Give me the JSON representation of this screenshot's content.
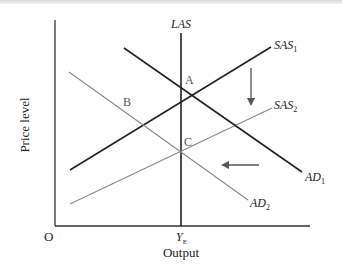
{
  "diagram": {
    "type": "AD-AS model",
    "axes": {
      "y_label": "Price level",
      "x_label": "Output",
      "origin_label": "O",
      "x_tick": {
        "main": "Y",
        "sub": "E"
      }
    },
    "curves": {
      "las": {
        "label": "LAS",
        "color": "#222222"
      },
      "sas1": {
        "main": "SAS",
        "sub": "1",
        "color": "#222222"
      },
      "sas2": {
        "main": "SAS",
        "sub": "2",
        "color": "#8a8a8a"
      },
      "ad1": {
        "main": "AD",
        "sub": "1",
        "color": "#222222"
      },
      "ad2": {
        "main": "AD",
        "sub": "2",
        "color": "#8a8a8a"
      }
    },
    "points": {
      "a": "A",
      "b": "B",
      "c": "C"
    },
    "arrows": {
      "down": "SAS shift down",
      "left": "AD shift left"
    }
  }
}
